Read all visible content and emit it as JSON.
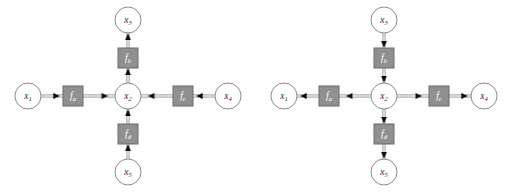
{
  "figure": {
    "panel_count": 2,
    "background_color": "#ffffff",
    "variable_node_color": "#ffffff",
    "variable_node_border_color": "#8a8a8a",
    "factor_node_color": "#909090",
    "factor_node_border_color": "#6a6a6a",
    "factor_label_color": "#ffffff",
    "edge_color": "#9a9a9a",
    "arrow_color": "#111111"
  },
  "panels": [
    {
      "id": "left",
      "name": "messages-toward-x3",
      "direction": "inward",
      "description": "Messages flow from the leaf variable nodes inward through the factor nodes to x2 and then on to x3",
      "variables": [
        {
          "id": "x1",
          "base": "x",
          "sub": "1",
          "label": "x1",
          "cx": 28,
          "cy": 96,
          "r": 13
        },
        {
          "id": "x2",
          "base": "x",
          "sub": "2",
          "label": "x2",
          "cx": 128,
          "cy": 96,
          "r": 13
        },
        {
          "id": "x3",
          "base": "x",
          "sub": "3",
          "label": "x3",
          "cx": 128,
          "cy": 20,
          "r": 13
        },
        {
          "id": "x4",
          "base": "x",
          "sub": "4",
          "label": "x4",
          "cx": 228,
          "cy": 96,
          "r": 13
        },
        {
          "id": "x5",
          "base": "x",
          "sub": "5",
          "label": "x5",
          "cx": 128,
          "cy": 172,
          "r": 13
        }
      ],
      "factors": [
        {
          "id": "fa",
          "base": "f",
          "sub": "a",
          "label": "fa",
          "cx": 73,
          "cy": 96,
          "w": 20,
          "h": 20
        },
        {
          "id": "fb",
          "base": "f",
          "sub": "b",
          "label": "fb",
          "cx": 128,
          "cy": 58,
          "w": 20,
          "h": 20
        },
        {
          "id": "fc",
          "base": "f",
          "sub": "c",
          "label": "fc",
          "cx": 183,
          "cy": 96,
          "w": 20,
          "h": 20
        },
        {
          "id": "fd",
          "base": "f",
          "sub": "d",
          "label": "fd",
          "cx": 128,
          "cy": 134,
          "w": 20,
          "h": 20
        }
      ],
      "edges": [
        {
          "id": "x1-fa",
          "from": "x1",
          "to": "fa",
          "arrow": "right"
        },
        {
          "id": "fa-x2",
          "from": "fa",
          "to": "x2",
          "arrow": "right"
        },
        {
          "id": "x4-fc",
          "from": "x4",
          "to": "fc",
          "arrow": "left"
        },
        {
          "id": "fc-x2",
          "from": "fc",
          "to": "x2",
          "arrow": "left"
        },
        {
          "id": "x5-fd",
          "from": "x5",
          "to": "fd",
          "arrow": "up"
        },
        {
          "id": "fd-x2",
          "from": "fd",
          "to": "x2",
          "arrow": "up"
        },
        {
          "id": "x2-fb",
          "from": "x2",
          "to": "fb",
          "arrow": "up"
        },
        {
          "id": "fb-x3",
          "from": "fb",
          "to": "x3",
          "arrow": "up"
        }
      ]
    },
    {
      "id": "right",
      "name": "messages-from-x3-outward",
      "direction": "outward",
      "description": "Messages flow from x3 down through x2 and outward to the leaf variable nodes x1, x4 and x5",
      "variables": [
        {
          "id": "x1",
          "base": "x",
          "sub": "1",
          "label": "x1",
          "cx": 28,
          "cy": 96,
          "r": 13
        },
        {
          "id": "x2",
          "base": "x",
          "sub": "2",
          "label": "x2",
          "cx": 128,
          "cy": 96,
          "r": 13
        },
        {
          "id": "x3",
          "base": "x",
          "sub": "3",
          "label": "x3",
          "cx": 128,
          "cy": 20,
          "r": 13
        },
        {
          "id": "x4",
          "base": "x",
          "sub": "4",
          "label": "x4",
          "cx": 228,
          "cy": 96,
          "r": 13
        },
        {
          "id": "x5",
          "base": "x",
          "sub": "5",
          "label": "x5",
          "cx": 128,
          "cy": 172,
          "r": 13
        }
      ],
      "factors": [
        {
          "id": "fa",
          "base": "f",
          "sub": "a",
          "label": "fa",
          "cx": 73,
          "cy": 96,
          "w": 20,
          "h": 20
        },
        {
          "id": "fb",
          "base": "f",
          "sub": "b",
          "label": "fb",
          "cx": 128,
          "cy": 58,
          "w": 20,
          "h": 20
        },
        {
          "id": "fc",
          "base": "f",
          "sub": "c",
          "label": "fc",
          "cx": 183,
          "cy": 96,
          "w": 20,
          "h": 20
        },
        {
          "id": "fd",
          "base": "f",
          "sub": "d",
          "label": "fd",
          "cx": 128,
          "cy": 134,
          "w": 20,
          "h": 20
        }
      ],
      "edges": [
        {
          "id": "x2-fa",
          "from": "x2",
          "to": "fa",
          "arrow": "left"
        },
        {
          "id": "fa-x1",
          "from": "fa",
          "to": "x1",
          "arrow": "left"
        },
        {
          "id": "x2-fc",
          "from": "x2",
          "to": "fc",
          "arrow": "right"
        },
        {
          "id": "fc-x4",
          "from": "fc",
          "to": "x4",
          "arrow": "right"
        },
        {
          "id": "x3-fb",
          "from": "x3",
          "to": "fb",
          "arrow": "down"
        },
        {
          "id": "fb-x2",
          "from": "fb",
          "to": "x2",
          "arrow": "down"
        },
        {
          "id": "x2-fd",
          "from": "x2",
          "to": "fd",
          "arrow": "down"
        },
        {
          "id": "fd-x5",
          "from": "fd",
          "to": "x5",
          "arrow": "down"
        }
      ]
    }
  ]
}
